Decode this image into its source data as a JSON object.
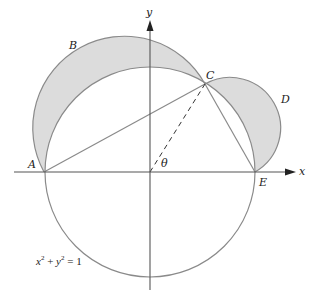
{
  "diagram": {
    "axes": {
      "x_label": "x",
      "y_label": "y"
    },
    "points": {
      "A": "A",
      "B": "B",
      "C": "C",
      "D": "D",
      "E": "E"
    },
    "angle_label": "θ",
    "equation": {
      "x": "x",
      "sup1": "2",
      "plus": " + ",
      "y": "y",
      "sup2": "2",
      "eq": " = 1"
    },
    "colors": {
      "stroke": "#8a8a8a",
      "shade": "#dcdcdc",
      "axis": "#555555",
      "text": "#222222"
    }
  }
}
